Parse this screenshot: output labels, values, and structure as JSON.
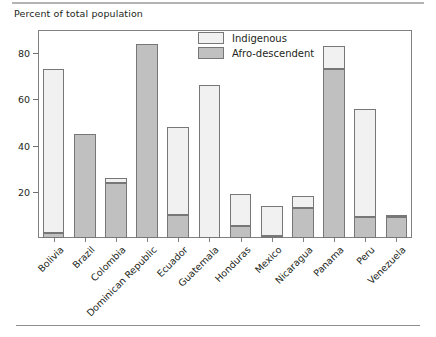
{
  "figure": {
    "axis_title": "Percent of total population",
    "rules": {
      "top": "divider-top",
      "bottom": "divider-bottom"
    }
  },
  "legend": {
    "position": "top-center",
    "entries": [
      {
        "label": "Indigenous",
        "color": "#f1f1f1",
        "swatch": "indigenous-swatch"
      },
      {
        "label": "Afro-descendent",
        "color": "#c0c0c0",
        "swatch": "afro-descendent-swatch"
      }
    ]
  },
  "chart_data": {
    "type": "bar",
    "subtype": "stacked",
    "title": "",
    "xlabel": "",
    "ylabel": "Percent of total population",
    "ylim": [
      0,
      90
    ],
    "yticks": [
      20,
      40,
      60,
      80
    ],
    "ytick_labels": [
      "20",
      "40",
      "60",
      "80"
    ],
    "grid": false,
    "categories": [
      "Bolivia",
      "Brazil",
      "Colombia",
      "Dominican Republic",
      "Ecuador",
      "Guatemala",
      "Honduras",
      "Mexico",
      "Nicaragua",
      "Panama",
      "Peru",
      "Venezuela"
    ],
    "series": [
      {
        "name": "Afro-descendent",
        "color": "#c0c0c0",
        "values": [
          2,
          45,
          24,
          84,
          10,
          0,
          5,
          1,
          13,
          73,
          9,
          9
        ]
      },
      {
        "name": "Indigenous",
        "color": "#f1f1f1",
        "values": [
          71,
          0,
          2,
          0,
          38,
          66,
          14,
          13,
          5,
          10,
          47,
          1
        ]
      }
    ],
    "totals": [
      73,
      45,
      26,
      84,
      48,
      66,
      19,
      14,
      18,
      83,
      56,
      10
    ]
  }
}
